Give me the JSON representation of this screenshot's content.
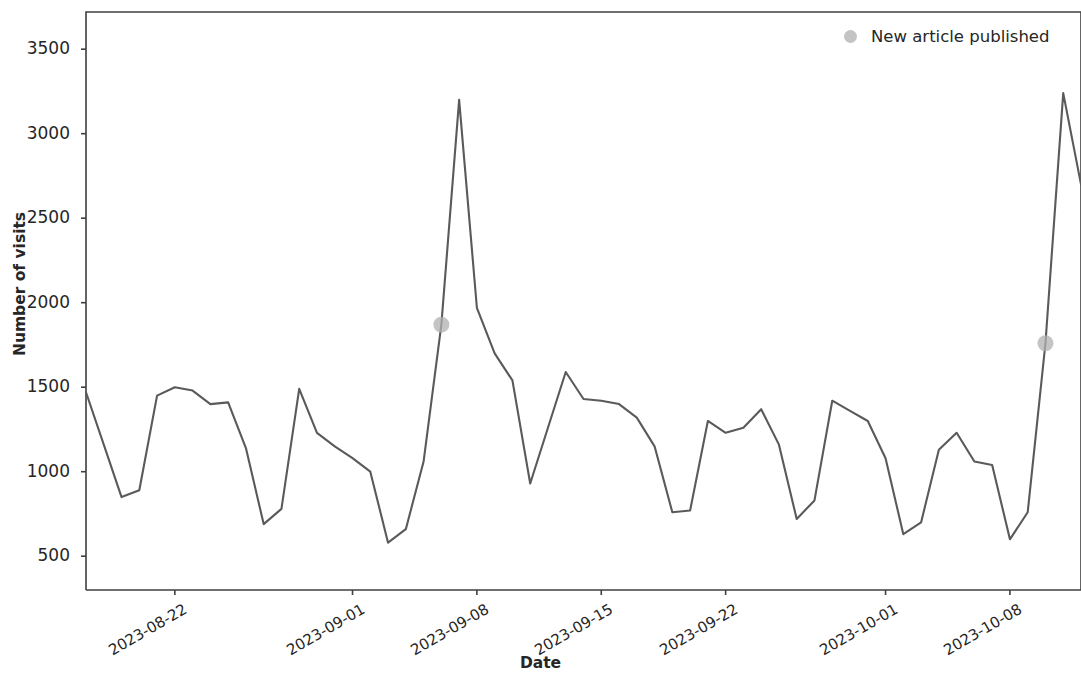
{
  "chart_data": {
    "type": "line",
    "title": "",
    "xlabel": "Date",
    "ylabel": "Number of visits",
    "grid": false,
    "legend_position": "upper right",
    "legend_entries": [
      {
        "label": "New article published",
        "marker": "circle",
        "color": "#b0b0b0"
      }
    ],
    "line_color": "#5a5a5a",
    "marker_color": "#b0b0b0",
    "ylim": [
      300,
      3720
    ],
    "yticks": [
      500,
      1000,
      1500,
      2000,
      2500,
      3000,
      3500
    ],
    "ytick_labels": [
      "500",
      "1000",
      "1500",
      "2000",
      "2500",
      "3000",
      "3500"
    ],
    "xlim": [
      "2023-08-17",
      "2023-10-12"
    ],
    "xticks": [
      "2023-08-22",
      "2023-09-01",
      "2023-09-08",
      "2023-09-15",
      "2023-09-22",
      "2023-10-01",
      "2023-10-08"
    ],
    "xtick_labels": [
      "2023-08-22",
      "2023-09-01",
      "2023-09-08",
      "2023-09-15",
      "2023-09-22",
      "2023-10-01",
      "2023-10-08"
    ],
    "x": [
      "2023-08-17",
      "2023-08-18",
      "2023-08-19",
      "2023-08-20",
      "2023-08-21",
      "2023-08-22",
      "2023-08-23",
      "2023-08-24",
      "2023-08-25",
      "2023-08-26",
      "2023-08-27",
      "2023-08-28",
      "2023-08-29",
      "2023-08-30",
      "2023-08-31",
      "2023-09-01",
      "2023-09-02",
      "2023-09-03",
      "2023-09-04",
      "2023-09-05",
      "2023-09-06",
      "2023-09-07",
      "2023-09-08",
      "2023-09-09",
      "2023-09-10",
      "2023-09-11",
      "2023-09-12",
      "2023-09-13",
      "2023-09-14",
      "2023-09-15",
      "2023-09-16",
      "2023-09-17",
      "2023-09-18",
      "2023-09-19",
      "2023-09-20",
      "2023-09-21",
      "2023-09-22",
      "2023-09-23",
      "2023-09-24",
      "2023-09-25",
      "2023-09-26",
      "2023-09-27",
      "2023-09-28",
      "2023-09-29",
      "2023-09-30",
      "2023-10-01",
      "2023-10-02",
      "2023-10-03",
      "2023-10-04",
      "2023-10-05",
      "2023-10-06",
      "2023-10-07",
      "2023-10-08",
      "2023-10-09",
      "2023-10-10",
      "2023-10-11",
      "2023-10-12"
    ],
    "values": [
      1470,
      1160,
      850,
      890,
      1450,
      1500,
      1480,
      1400,
      1410,
      1140,
      690,
      780,
      1490,
      1230,
      1150,
      1080,
      1000,
      580,
      660,
      1060,
      1870,
      3200,
      1970,
      1700,
      1540,
      930,
      1260,
      1590,
      1430,
      1420,
      1400,
      1320,
      1150,
      760,
      770,
      1300,
      1230,
      1260,
      1370,
      1160,
      720,
      830,
      1420,
      1360,
      1300,
      1080,
      630,
      700,
      1130,
      1230,
      1060,
      1040,
      600,
      760,
      1760,
      3240,
      2700
    ],
    "annotations": [
      {
        "name": "New article published",
        "x": "2023-09-06",
        "y": 1870
      },
      {
        "name": "New article published",
        "x": "2023-10-10",
        "y": 1760
      }
    ]
  },
  "axes": {
    "ylabel": "Number of visits",
    "xlabel": "Date"
  },
  "legend": {
    "label": "New article published"
  }
}
